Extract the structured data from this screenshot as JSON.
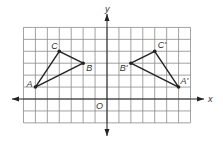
{
  "figure": {
    "type": "coordinate-plane-reflection",
    "grid": {
      "x_min": -7,
      "x_max": 7,
      "y_min": -2,
      "y_max": 6,
      "cell_px": 11.93,
      "origin_px": [
        107,
        99
      ],
      "grid_color": "#8a8a8a",
      "line_color": "#222222"
    },
    "axes": {
      "x_label": "x",
      "y_label": "y",
      "origin_label": "O"
    },
    "triangles": [
      {
        "name": "ABC",
        "vertices": [
          {
            "label": "A",
            "x": -6,
            "y": 1
          },
          {
            "label": "B",
            "x": -2,
            "y": 3
          },
          {
            "label": "C",
            "x": -4,
            "y": 4
          }
        ]
      },
      {
        "name": "A'B'C'",
        "vertices": [
          {
            "label": "A'",
            "x": 6,
            "y": 1
          },
          {
            "label": "B'",
            "x": 2,
            "y": 3
          },
          {
            "label": "C'",
            "x": 4,
            "y": 4
          }
        ]
      }
    ]
  }
}
